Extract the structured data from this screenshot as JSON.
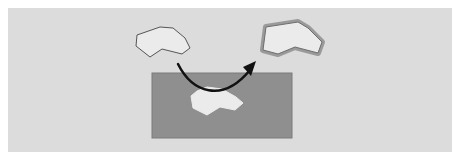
{
  "diagram": {
    "colors": {
      "page_background": "#ffffff",
      "panel_background": "#dcdcdc",
      "region_fill": "#8f8f8f",
      "region_stroke": "#7a7a7a",
      "polygon_fill": "#ebebeb",
      "polygon_stroke": "#555555",
      "highlight_stroke": "#9a9a9a",
      "arrow_color": "#111111"
    },
    "panel": {
      "x": 8,
      "y": 8,
      "width": 444,
      "height": 144
    },
    "region": {
      "x": 152,
      "y": 73,
      "width": 140,
      "height": 65
    },
    "shapes": [
      {
        "name": "source-polygon",
        "points": "137,35 160,27 173,28 185,38 190,48 182,54 162,49 150,57 136,46"
      },
      {
        "name": "region-polygon",
        "points": "197,91 207,87 222,89 236,97 243,103 235,110 220,107 207,115 193,108 191,96"
      },
      {
        "name": "highlighted-polygon",
        "points": "266,27 298,22 308,28 322,42 318,53 295,47 278,54 263,50"
      }
    ],
    "arrow": {
      "path": "M 178 64 C 192 92, 222 104, 250 70",
      "head_points": "256,61 243,67 251,76"
    }
  }
}
